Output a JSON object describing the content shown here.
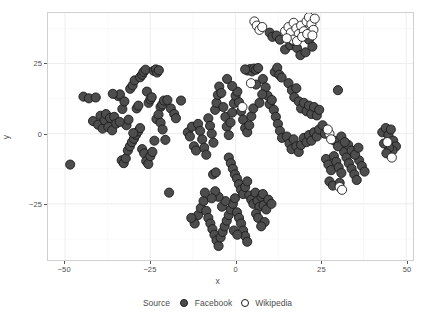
{
  "chart_data": {
    "type": "scatter",
    "title": "",
    "xlabel": "x",
    "ylabel": "y",
    "xlim": [
      -55,
      52
    ],
    "ylim": [
      -45,
      43
    ],
    "xticks": [
      -50,
      -25,
      0,
      25,
      50
    ],
    "yticks": [
      25,
      0,
      -25
    ],
    "xtick_labels": [
      "-50",
      "-25",
      "0",
      "25",
      "50"
    ],
    "ytick_labels": [
      "25",
      "0",
      "-25"
    ],
    "grid": true,
    "legend_position": "bottom",
    "legend_title": "Source",
    "series": [
      {
        "name": "Facebook",
        "marker": "filled-circle",
        "color": "#4d4d4d",
        "points": [
          [
            -48.5,
            -11.0
          ],
          [
            -44.6,
            13.2
          ],
          [
            -43.0,
            12.6
          ],
          [
            -41.8,
            4.5
          ],
          [
            -41.0,
            12.9
          ],
          [
            -40.3,
            3.2
          ],
          [
            -39.6,
            6.4
          ],
          [
            -39.0,
            1.8
          ],
          [
            -38.4,
            4.8
          ],
          [
            -38.0,
            7.0
          ],
          [
            -37.3,
            2.4
          ],
          [
            -36.8,
            5.6
          ],
          [
            -36.2,
            1.2
          ],
          [
            -35.6,
            6.0
          ],
          [
            -35.0,
            3.6
          ],
          [
            -34.4,
            13.4
          ],
          [
            -33.9,
            14.0
          ],
          [
            -33.2,
            8.8
          ],
          [
            -32.6,
            11.5
          ],
          [
            -32.0,
            3.0
          ],
          [
            -31.4,
            5.0
          ],
          [
            -30.9,
            16.0
          ],
          [
            -30.2,
            17.2
          ],
          [
            -29.6,
            19.0
          ],
          [
            -29.0,
            9.0
          ],
          [
            -28.5,
            10.0
          ],
          [
            -28.0,
            20.1
          ],
          [
            -27.4,
            21.0
          ],
          [
            -27.0,
            22.0
          ],
          [
            -26.4,
            22.8
          ],
          [
            -26.0,
            15.0
          ],
          [
            -25.5,
            11.0
          ],
          [
            -25.0,
            12.2
          ],
          [
            -24.6,
            13.0
          ],
          [
            -24.0,
            22.4
          ],
          [
            -23.4,
            22.9
          ],
          [
            -23.0,
            21.8
          ],
          [
            -22.5,
            22.6
          ],
          [
            -22.0,
            9.5
          ],
          [
            -21.5,
            10.4
          ],
          [
            -21.0,
            11.8
          ],
          [
            -33.4,
            -9.5
          ],
          [
            -32.8,
            -10.5
          ],
          [
            -32.2,
            -8.8
          ],
          [
            -31.6,
            -6.0
          ],
          [
            -31.0,
            -4.5
          ],
          [
            -30.4,
            -3.0
          ],
          [
            -29.8,
            -1.8
          ],
          [
            -29.2,
            -0.4
          ],
          [
            -28.6,
            0.8
          ],
          [
            -28.0,
            2.0
          ],
          [
            -27.4,
            -5.5
          ],
          [
            -26.8,
            -7.0
          ],
          [
            -26.2,
            -9.8
          ],
          [
            -25.6,
            -10.8
          ],
          [
            -25.0,
            -8.0
          ],
          [
            -24.4,
            -6.5
          ],
          [
            -23.8,
            -2.5
          ],
          [
            -23.2,
            5.2
          ],
          [
            -22.6,
            6.8
          ],
          [
            -22.0,
            3.9
          ],
          [
            -21.4,
            1.5
          ],
          [
            -20.6,
            -2.2
          ],
          [
            -19.5,
            -21.0
          ],
          [
            -16.0,
            11.8
          ],
          [
            -14.0,
            0.5
          ],
          [
            -13.4,
            -1.0
          ],
          [
            -12.8,
            2.5
          ],
          [
            -12.2,
            -4.5
          ],
          [
            -11.6,
            -6.0
          ],
          [
            -11.0,
            3.5
          ],
          [
            -10.4,
            1.0
          ],
          [
            -9.8,
            -2.0
          ],
          [
            -9.2,
            -5.0
          ],
          [
            -8.6,
            -7.5
          ],
          [
            -8.0,
            5.5
          ],
          [
            -7.5,
            2.8
          ],
          [
            -7.0,
            0.0
          ],
          [
            -6.5,
            -3.2
          ],
          [
            -6.0,
            8.5
          ],
          [
            -5.6,
            11.0
          ],
          [
            -5.2,
            13.8
          ],
          [
            -4.8,
            16.8
          ],
          [
            -4.2,
            14.5
          ],
          [
            -3.6,
            9.5
          ],
          [
            -3.0,
            6.0
          ],
          [
            -2.6,
            2.5
          ],
          [
            -2.0,
            -0.5
          ],
          [
            -1.5,
            4.0
          ],
          [
            -1.0,
            7.5
          ],
          [
            -0.5,
            10.8
          ],
          [
            0.0,
            13.5
          ],
          [
            0.5,
            15.0
          ],
          [
            1.0,
            11.2
          ],
          [
            1.6,
            8.0
          ],
          [
            2.2,
            5.0
          ],
          [
            2.8,
            2.0
          ],
          [
            3.4,
            0.5
          ],
          [
            4.0,
            3.0
          ],
          [
            4.6,
            6.2
          ],
          [
            5.2,
            9.0
          ],
          [
            -6.6,
            -14.5
          ],
          [
            -5.8,
            -13.8
          ],
          [
            -2.0,
            -8.5
          ],
          [
            -1.4,
            -10.5
          ],
          [
            -0.8,
            -12.5
          ],
          [
            -0.2,
            -14.5
          ],
          [
            0.4,
            -16.0
          ],
          [
            1.0,
            -18.0
          ],
          [
            1.6,
            -20.0
          ],
          [
            2.2,
            -21.5
          ],
          [
            2.8,
            -19.0
          ],
          [
            3.4,
            -17.0
          ],
          [
            4.0,
            -22.0
          ],
          [
            4.6,
            -23.5
          ],
          [
            5.2,
            -25.0
          ],
          [
            5.8,
            -21.0
          ],
          [
            6.4,
            -24.0
          ],
          [
            7.0,
            -26.0
          ],
          [
            7.6,
            -22.5
          ],
          [
            8.2,
            -25.5
          ],
          [
            9.0,
            -27.0
          ],
          [
            -11.0,
            -29.0
          ],
          [
            -10.2,
            -26.5
          ],
          [
            -9.4,
            -24.0
          ],
          [
            -8.6,
            -27.5
          ],
          [
            -8.0,
            -30.0
          ],
          [
            -7.4,
            -32.0
          ],
          [
            -6.8,
            -34.0
          ],
          [
            -6.2,
            -36.0
          ],
          [
            -5.6,
            -38.0
          ],
          [
            -5.0,
            -40.0
          ],
          [
            -4.4,
            -37.0
          ],
          [
            -3.8,
            -35.0
          ],
          [
            -3.2,
            -33.0
          ],
          [
            -2.6,
            -31.0
          ],
          [
            -2.0,
            -29.0
          ],
          [
            -1.4,
            -27.0
          ],
          [
            -0.8,
            -25.0
          ],
          [
            -0.2,
            -23.0
          ],
          [
            0.4,
            -28.0
          ],
          [
            1.0,
            -30.0
          ],
          [
            1.6,
            -32.0
          ],
          [
            2.2,
            -34.5
          ],
          [
            2.8,
            -36.5
          ],
          [
            3.4,
            -38.5
          ],
          [
            -4.0,
            -26.0
          ],
          [
            -3.0,
            -24.0
          ],
          [
            -5.0,
            -22.5
          ],
          [
            -6.0,
            -20.5
          ],
          [
            -7.0,
            -23.0
          ],
          [
            -9.0,
            -21.0
          ],
          [
            -0.5,
            -34.5
          ],
          [
            0.5,
            -36.0
          ],
          [
            6.0,
            -28.5
          ],
          [
            6.6,
            -30.0
          ],
          [
            8.0,
            -21.5
          ],
          [
            9.6,
            -23.5
          ],
          [
            10.5,
            -25.0
          ],
          [
            3.5,
            22.5
          ],
          [
            4.2,
            23.0
          ],
          [
            4.8,
            22.2
          ],
          [
            5.4,
            23.2
          ],
          [
            6.0,
            22.8
          ],
          [
            6.6,
            23.4
          ],
          [
            2.8,
            22.9
          ],
          [
            8.0,
            19.5
          ],
          [
            8.8,
            16.5
          ],
          [
            9.4,
            13.5
          ],
          [
            10.0,
            10.5
          ],
          [
            10.6,
            12.0
          ],
          [
            11.2,
            8.5
          ],
          [
            11.8,
            6.0
          ],
          [
            12.4,
            3.5
          ],
          [
            13.0,
            1.0
          ],
          [
            13.6,
            -1.5
          ],
          [
            11.5,
            22.0
          ],
          [
            12.2,
            23.5
          ],
          [
            12.8,
            21.0
          ],
          [
            13.5,
            20.0
          ],
          [
            10.0,
            36.0
          ],
          [
            10.8,
            34.5
          ],
          [
            14.5,
            30.0
          ],
          [
            16.0,
            31.5
          ],
          [
            17.0,
            33.0
          ],
          [
            18.0,
            30.5
          ],
          [
            19.0,
            28.0
          ],
          [
            20.5,
            29.0
          ],
          [
            15.5,
            18.0
          ],
          [
            16.5,
            15.5
          ],
          [
            17.2,
            13.0
          ],
          [
            17.8,
            16.2
          ],
          [
            18.5,
            11.5
          ],
          [
            19.2,
            9.0
          ],
          [
            20.0,
            11.0
          ],
          [
            20.8,
            8.0
          ],
          [
            21.5,
            10.0
          ],
          [
            22.2,
            7.0
          ],
          [
            23.0,
            9.5
          ],
          [
            23.8,
            6.5
          ],
          [
            24.5,
            8.5
          ],
          [
            15.0,
            -1.0
          ],
          [
            15.8,
            -3.5
          ],
          [
            16.4,
            -5.5
          ],
          [
            17.0,
            -2.0
          ],
          [
            17.8,
            -4.5
          ],
          [
            18.5,
            -6.5
          ],
          [
            19.2,
            -4.0
          ],
          [
            20.0,
            -1.5
          ],
          [
            20.8,
            -3.0
          ],
          [
            21.5,
            -0.5
          ],
          [
            22.2,
            -2.5
          ],
          [
            23.0,
            0.5
          ],
          [
            23.8,
            -1.0
          ],
          [
            24.5,
            1.5
          ],
          [
            25.5,
            3.0
          ],
          [
            26.2,
            0.0
          ],
          [
            30.0,
            15.5
          ],
          [
            26.5,
            -9.0
          ],
          [
            27.2,
            -11.0
          ],
          [
            28.0,
            -13.0
          ],
          [
            28.8,
            -8.0
          ],
          [
            29.5,
            -10.0
          ],
          [
            30.2,
            -12.0
          ],
          [
            31.0,
            -14.0
          ],
          [
            31.8,
            -6.5
          ],
          [
            32.5,
            -8.5
          ],
          [
            33.2,
            -10.5
          ],
          [
            34.0,
            -12.5
          ],
          [
            34.8,
            -14.5
          ],
          [
            35.5,
            -16.5
          ],
          [
            36.2,
            -9.5
          ],
          [
            37.0,
            -11.5
          ],
          [
            37.8,
            -13.5
          ],
          [
            33.0,
            -4.0
          ],
          [
            34.0,
            -6.0
          ],
          [
            35.0,
            -7.5
          ],
          [
            36.0,
            -5.0
          ],
          [
            29.0,
            -2.5
          ],
          [
            30.0,
            -4.5
          ],
          [
            31.0,
            -1.0
          ],
          [
            32.0,
            -3.0
          ],
          [
            43.0,
            0.5
          ],
          [
            44.0,
            2.0
          ],
          [
            44.8,
            -0.5
          ],
          [
            45.5,
            1.5
          ],
          [
            46.2,
            -2.5
          ],
          [
            47.0,
            -4.5
          ],
          [
            46.0,
            -6.0
          ],
          [
            45.0,
            -5.0
          ],
          [
            44.2,
            -7.0
          ],
          [
            43.5,
            -3.5
          ],
          [
            27.5,
            -17.0
          ],
          [
            28.5,
            -18.5
          ],
          [
            30.5,
            -17.5
          ],
          [
            -19.0,
            9.0
          ],
          [
            -18.0,
            7.0
          ],
          [
            -17.5,
            5.5
          ],
          [
            -20.0,
            12.0
          ],
          [
            -36.0,
            14.2
          ],
          [
            -34.0,
            4.2
          ],
          [
            -30.0,
            0.2
          ],
          [
            -2.5,
            19.5
          ],
          [
            -1.0,
            17.0
          ],
          [
            7.0,
            11.0
          ],
          [
            7.8,
            14.0
          ],
          [
            6.0,
            17.5
          ],
          [
            12.0,
            35.0
          ],
          [
            13.0,
            33.5
          ],
          [
            21.5,
            33.5
          ],
          [
            22.5,
            31.0
          ],
          [
            8.5,
            -31.5
          ],
          [
            7.5,
            -33.0
          ],
          [
            -12.0,
            -32.0
          ],
          [
            -13.0,
            -30.0
          ]
        ]
      },
      {
        "name": "Wikipedia",
        "marker": "open-circle",
        "color": "#ffffff",
        "points": [
          [
            5.5,
            40.0
          ],
          [
            6.2,
            38.5
          ],
          [
            7.0,
            37.0
          ],
          [
            7.8,
            38.0
          ],
          [
            14.5,
            36.5
          ],
          [
            15.5,
            38.0
          ],
          [
            16.2,
            36.0
          ],
          [
            17.0,
            39.5
          ],
          [
            17.8,
            37.5
          ],
          [
            18.5,
            35.5
          ],
          [
            19.2,
            38.5
          ],
          [
            20.0,
            36.5
          ],
          [
            20.8,
            40.0
          ],
          [
            21.5,
            41.5
          ],
          [
            22.2,
            39.0
          ],
          [
            22.8,
            37.0
          ],
          [
            16.8,
            33.5
          ],
          [
            18.0,
            33.0
          ],
          [
            19.5,
            34.5
          ],
          [
            15.0,
            34.0
          ],
          [
            21.0,
            35.5
          ],
          [
            22.5,
            35.0
          ],
          [
            23.2,
            41.0
          ],
          [
            4.5,
            18.0
          ],
          [
            2.0,
            9.5
          ],
          [
            27.5,
            0.0
          ],
          [
            28.0,
            -2.0
          ],
          [
            27.0,
            1.5
          ],
          [
            44.5,
            -3.0
          ],
          [
            45.8,
            -8.5
          ],
          [
            30.5,
            -19.0
          ],
          [
            31.2,
            -20.0
          ]
        ]
      }
    ]
  },
  "legend": {
    "title": "Source",
    "entries": [
      {
        "label": "Facebook",
        "marker": "filled-circle"
      },
      {
        "label": "Wikipedia",
        "marker": "open-circle"
      }
    ]
  },
  "colors": {
    "facebook_fill": "#4d4d4d",
    "wikipedia_fill": "#ffffff",
    "marker_stroke": "#1a1a1a",
    "panel_background": "#ffffff",
    "panel_border": "#d0d0d0",
    "gridline_major": "#ebebeb",
    "axis_text": "#4d4d4d"
  }
}
